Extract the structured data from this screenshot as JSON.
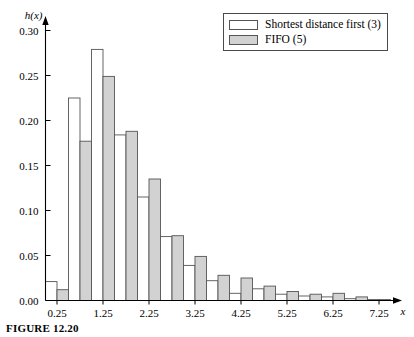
{
  "figure": {
    "caption": "FIGURE 12.20"
  },
  "legend": {
    "position": "top-right",
    "entries": [
      {
        "label": "Shortest distance first (3)",
        "swatch": "white",
        "color": "#ffffff"
      },
      {
        "label": "FIFO (5)",
        "swatch": "gray",
        "color": "#d2d2d2"
      }
    ]
  },
  "chart_data": {
    "type": "bar",
    "title": "",
    "subtitle": "",
    "xlabel": "x",
    "ylabel": "h(x)",
    "xlim": [
      0.0,
      7.75
    ],
    "ylim": [
      0.0,
      0.315
    ],
    "grid": false,
    "bin_width": 0.25,
    "xticks": [
      0.25,
      1.25,
      2.25,
      3.25,
      4.25,
      5.25,
      6.25,
      7.25
    ],
    "xtick_labels": [
      "0.25",
      "1.25",
      "2.25",
      "3.25",
      "4.25",
      "5.25",
      "6.25",
      "7.25"
    ],
    "yticks": [
      0.0,
      0.05,
      0.1,
      0.15,
      0.2,
      0.25,
      0.3
    ],
    "ytick_labels": [
      "0.00",
      "0.05",
      "0.10",
      "0.15",
      "0.20",
      "0.25",
      "0.30"
    ],
    "categories": [
      0.25,
      0.5,
      0.75,
      1.0,
      1.25,
      1.5,
      1.75,
      2.0,
      2.25,
      2.5,
      2.75,
      3.0,
      3.25,
      3.5,
      3.75,
      4.0,
      4.25,
      4.5,
      4.75,
      5.0,
      5.25,
      5.5,
      5.75,
      6.0,
      6.25,
      6.5,
      6.75,
      7.0,
      7.25
    ],
    "series": [
      {
        "name": "Shortest distance first (3)",
        "color": "#ffffff",
        "edge": "#555555",
        "values": [
          0.021,
          0.0,
          0.225,
          0.0,
          0.279,
          0.0,
          0.184,
          0.0,
          0.115,
          0.0,
          0.071,
          0.0,
          0.039,
          0.0,
          0.022,
          0.0,
          0.008,
          0.0,
          0.013,
          0.0,
          0.007,
          0.0,
          0.005,
          0.0,
          0.004,
          0.0,
          0.002,
          0.0,
          0.001
        ]
      },
      {
        "name": "FIFO (5)",
        "color": "#d2d2d2",
        "edge": "#555555",
        "values": [
          0.012,
          0.0,
          0.177,
          0.0,
          0.249,
          0.0,
          0.188,
          0.0,
          0.135,
          0.0,
          0.072,
          0.0,
          0.049,
          0.0,
          0.028,
          0.0,
          0.025,
          0.0,
          0.016,
          0.0,
          0.01,
          0.0,
          0.007,
          0.0,
          0.008,
          0.0,
          0.004,
          0.0,
          0.001
        ]
      }
    ],
    "bars": [
      {
        "x": 0.25,
        "white": 0.021,
        "gray": 0.012
      },
      {
        "x": 0.75,
        "white": 0.225,
        "gray": 0.177
      },
      {
        "x": 1.25,
        "white": 0.279,
        "gray": 0.249
      },
      {
        "x": 1.75,
        "white": 0.184,
        "gray": 0.188
      },
      {
        "x": 2.25,
        "white": 0.115,
        "gray": 0.135
      },
      {
        "x": 2.75,
        "white": 0.071,
        "gray": 0.072
      },
      {
        "x": 3.25,
        "white": 0.039,
        "gray": 0.049
      },
      {
        "x": 3.75,
        "white": 0.022,
        "gray": 0.028
      },
      {
        "x": 4.25,
        "white": 0.008,
        "gray": 0.025
      },
      {
        "x": 4.75,
        "white": 0.013,
        "gray": 0.016
      },
      {
        "x": 5.25,
        "white": 0.007,
        "gray": 0.01
      },
      {
        "x": 5.75,
        "white": 0.005,
        "gray": 0.007
      },
      {
        "x": 6.25,
        "white": 0.004,
        "gray": 0.008
      },
      {
        "x": 6.75,
        "white": 0.002,
        "gray": 0.004
      },
      {
        "x": 7.25,
        "white": 0.001,
        "gray": 0.001
      }
    ]
  }
}
